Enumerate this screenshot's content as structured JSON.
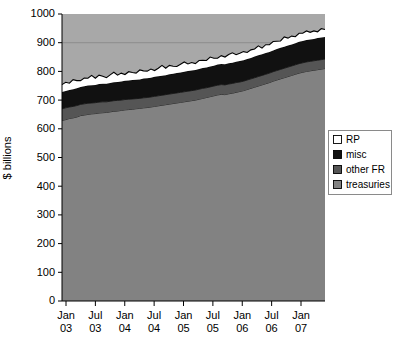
{
  "chart_data": {
    "type": "area",
    "stacked": true,
    "title": "",
    "subtitle": "",
    "xlabel": "",
    "ylabel": "$ billions",
    "ylim": [
      0,
      1000
    ],
    "ytick_step": 100,
    "yticks": [
      0,
      100,
      200,
      300,
      400,
      500,
      600,
      700,
      800,
      900,
      1000
    ],
    "ytick_labels": [
      "0",
      "100",
      "200",
      "300",
      "400",
      "500",
      "600",
      "700",
      "800",
      "900",
      "1000"
    ],
    "gridlines": [
      "900"
    ],
    "grid": "horizontal-faint",
    "legend_position": "right-middle",
    "xtick_labels": [
      {
        "line1": "Jan",
        "line2": "03"
      },
      {
        "line1": "Jul",
        "line2": "03"
      },
      {
        "line1": "Jan",
        "line2": "04"
      },
      {
        "line1": "Jul",
        "line2": "04"
      },
      {
        "line1": "Jan",
        "line2": "05"
      },
      {
        "line1": "Jul",
        "line2": "05"
      },
      {
        "line1": "Jan",
        "line2": "06"
      },
      {
        "line1": "Jul",
        "line2": "06"
      },
      {
        "line1": "Jan",
        "line2": "07"
      }
    ],
    "x_start_label": "Jan 03",
    "x_end_label": "Jul 07",
    "series": [
      {
        "name": "treasuries",
        "color": "#828282",
        "order": 1,
        "values": [
          629,
          632,
          636,
          638,
          641,
          646,
          648,
          650,
          652,
          653,
          655,
          656,
          657,
          659,
          661,
          662,
          664,
          666,
          667,
          668,
          670,
          671,
          673,
          674,
          676,
          678,
          680,
          682,
          684,
          686,
          688,
          690,
          692,
          694,
          696,
          698,
          700,
          703,
          706,
          709,
          712,
          715,
          718,
          720,
          719,
          722,
          724,
          727,
          730,
          733,
          737,
          741,
          745,
          749,
          753,
          757,
          761,
          766,
          770,
          774,
          778,
          782,
          786,
          790,
          794,
          797,
          800,
          802,
          804,
          806,
          808,
          810
        ]
      },
      {
        "name": "other FR",
        "color": "#555555",
        "order": 2,
        "values": [
          41,
          41,
          40,
          40,
          40,
          39,
          39,
          39,
          38,
          38,
          38,
          38,
          37,
          37,
          37,
          37,
          36,
          36,
          36,
          36,
          35,
          35,
          35,
          35,
          35,
          35,
          35,
          35,
          35,
          35,
          35,
          35,
          35,
          35,
          35,
          35,
          35,
          35,
          35,
          34,
          34,
          34,
          34,
          34,
          34,
          34,
          34,
          34,
          33,
          33,
          33,
          33,
          33,
          33,
          33,
          33,
          33,
          33,
          33,
          33,
          33,
          33,
          33,
          33,
          33,
          33,
          33,
          33,
          33,
          33,
          33,
          33
        ]
      },
      {
        "name": "misc",
        "color": "#111111",
        "order": 3,
        "values": [
          58,
          59,
          59,
          60,
          60,
          61,
          61,
          62,
          62,
          62,
          63,
          63,
          63,
          64,
          64,
          64,
          65,
          65,
          65,
          66,
          66,
          66,
          67,
          67,
          67,
          68,
          68,
          68,
          68,
          69,
          69,
          69,
          69,
          70,
          70,
          70,
          70,
          70,
          71,
          71,
          71,
          71,
          72,
          72,
          72,
          72,
          72,
          73,
          73,
          73,
          73,
          73,
          74,
          74,
          74,
          74,
          74,
          74,
          75,
          75,
          75,
          75,
          75,
          75,
          76,
          76,
          76,
          76,
          76,
          77,
          77,
          77
        ]
      },
      {
        "name": "RP",
        "color": "#ffffff",
        "order": 4,
        "values": [
          26,
          30,
          24,
          33,
          27,
          22,
          29,
          25,
          34,
          23,
          31,
          26,
          21,
          28,
          35,
          24,
          29,
          22,
          31,
          26,
          23,
          33,
          27,
          25,
          30,
          22,
          28,
          36,
          24,
          31,
          26,
          23,
          29,
          34,
          25,
          28,
          22,
          30,
          27,
          24,
          33,
          26,
          22,
          29,
          25,
          31,
          35,
          24,
          27,
          30,
          23,
          28,
          26,
          33,
          21,
          29,
          25,
          31,
          27,
          24,
          34,
          26,
          29,
          23,
          30,
          27,
          32,
          25,
          28,
          22,
          31,
          26
        ]
      }
    ],
    "totals_note": {
      "start_total": "754",
      "end_total": "946"
    }
  },
  "legend": {
    "items": [
      {
        "label": "RP",
        "color": "#ffffff"
      },
      {
        "label": "misc",
        "color": "#111111"
      },
      {
        "label": "other FR",
        "color": "#555555"
      },
      {
        "label": "treasuries",
        "color": "#828282"
      }
    ]
  },
  "axes": {
    "y_title": "$ billions"
  }
}
